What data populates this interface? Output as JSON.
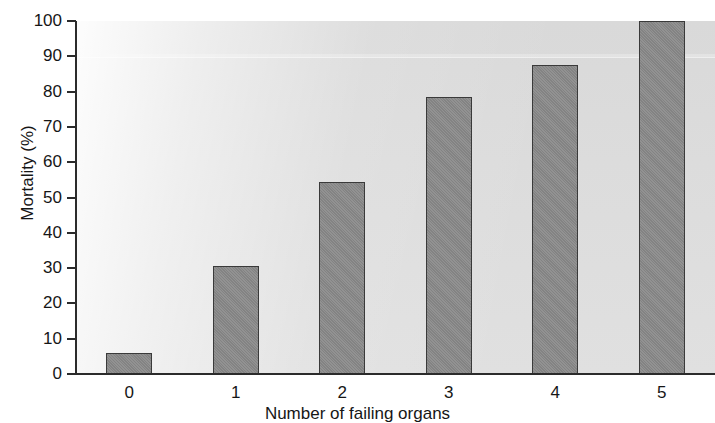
{
  "chart_data": {
    "type": "bar",
    "title": "",
    "xlabel": "Number of failing organs",
    "ylabel": "Mortality (%)",
    "categories": [
      "0",
      "1",
      "2",
      "3",
      "4",
      "5"
    ],
    "values": [
      6,
      30.5,
      54.5,
      78.5,
      87.5,
      100
    ],
    "ylim": [
      0,
      100
    ],
    "y_ticks": [
      "0",
      "10",
      "20",
      "30",
      "40",
      "50",
      "60",
      "70",
      "80",
      "90",
      "100"
    ],
    "y_tick_values": [
      0,
      10,
      20,
      30,
      40,
      50,
      60,
      70,
      80,
      90,
      100
    ],
    "x_ticks": [
      "0",
      "1",
      "2",
      "3",
      "4",
      "5"
    ],
    "grid": false,
    "legend": null,
    "bar_color": "#8a8a8a",
    "bar_edge_color": "#3a3a3a",
    "plot_background_color": "#dcdcdc",
    "axis_color": "#2b2b2b",
    "text_color": "#161616"
  }
}
